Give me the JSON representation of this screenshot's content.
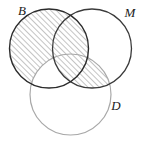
{
  "figure": {
    "kind": "venn-diagram",
    "width": 146,
    "height": 142,
    "background": "#ffffff"
  },
  "labels": {
    "b": "B",
    "m": "M",
    "d": "D"
  },
  "label_positions": {
    "b": {
      "x": 22,
      "y": 15
    },
    "m": {
      "x": 130,
      "y": 17
    },
    "d": {
      "x": 116,
      "y": 110
    }
  },
  "circles": [
    {
      "id": "B",
      "label": "B",
      "cx": 49,
      "cy": 48.5,
      "r": 39.5,
      "stroke": "#2b2b2b",
      "stroke_width": 1.4
    },
    {
      "id": "M",
      "label": "M",
      "cx": 92,
      "cy": 48.5,
      "r": 39.5,
      "stroke": "#3a3a3a",
      "stroke_width": 1.3
    },
    {
      "id": "D",
      "label": "D",
      "cx": 70.5,
      "cy": 94.5,
      "r": 40.5,
      "stroke": "#a8a8a8",
      "stroke_width": 1.2
    }
  ],
  "shading": {
    "pattern": "diagonal-hatch",
    "angle_deg": 45,
    "direction": "lower-left-to-upper-right",
    "spacing_px": 4,
    "line_color": "#555555",
    "line_width": 0.7,
    "description": "B excluding the part of B inside D that is outside M, together with the intersection of M and D",
    "shaded_regions": [
      "B minus D",
      "B intersect M",
      "B intersect M intersect D",
      "M intersect D"
    ]
  },
  "colors": {
    "background": "#ffffff",
    "stroke_dark": "#2b2b2b",
    "stroke_light": "#a8a8a8",
    "hatch": "#555555",
    "label": "#1a1a1a"
  }
}
